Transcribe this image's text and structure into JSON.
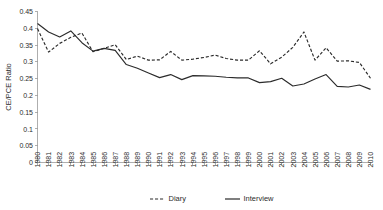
{
  "chart_data": {
    "type": "line",
    "title": "",
    "xlabel": "",
    "ylabel": "CE/PCE Ratio",
    "ylim": [
      0,
      0.45
    ],
    "ytick_step": 0.05,
    "grid": false,
    "legend_position": "bottom",
    "x": [
      1980,
      1981,
      1982,
      1983,
      1984,
      1985,
      1986,
      1987,
      1988,
      1989,
      1990,
      1991,
      1992,
      1993,
      1994,
      1995,
      1996,
      1997,
      1998,
      1999,
      2000,
      2001,
      2002,
      2003,
      2004,
      2005,
      2006,
      2007,
      2008,
      2009,
      2010
    ],
    "xtick_labels": [
      "1980",
      "1981",
      "1982",
      "1983",
      "1984",
      "1985",
      "1986",
      "1987",
      "1988",
      "1989",
      "1990",
      "1991",
      "1992",
      "1993",
      "1994",
      "1995",
      "1996",
      "1997",
      "1998",
      "1999",
      "2000",
      "2001",
      "2002",
      "2003",
      "2004",
      "2005",
      "2006",
      "2007",
      "2008",
      "2009",
      "2010"
    ],
    "ytick_labels": [
      "0",
      "0.05",
      "0.1",
      "0.15",
      "0.2",
      "0.25",
      "0.3",
      "0.35",
      "0.4",
      "0.45"
    ],
    "ytick_values": [
      0,
      0.05,
      0.1,
      0.15,
      0.2,
      0.25,
      0.3,
      0.35,
      0.4,
      0.45
    ],
    "series": [
      {
        "name": "Diary",
        "style": "dashed",
        "color": "#2b2b2b",
        "values": [
          0.399,
          0.329,
          0.355,
          0.373,
          0.386,
          0.33,
          0.34,
          0.351,
          0.307,
          0.317,
          0.305,
          0.306,
          0.331,
          0.305,
          0.308,
          0.313,
          0.32,
          0.31,
          0.305,
          0.305,
          0.333,
          0.294,
          0.314,
          0.343,
          0.389,
          0.305,
          0.342,
          0.302,
          0.303,
          0.298,
          0.251
        ]
      },
      {
        "name": "Interview",
        "style": "solid",
        "color": "#2b2b2b",
        "values": [
          0.414,
          0.389,
          0.374,
          0.392,
          0.357,
          0.332,
          0.34,
          0.334,
          0.292,
          0.281,
          0.267,
          0.253,
          0.262,
          0.247,
          0.259,
          0.258,
          0.257,
          0.254,
          0.252,
          0.252,
          0.238,
          0.241,
          0.251,
          0.228,
          0.234,
          0.249,
          0.262,
          0.227,
          0.225,
          0.231,
          0.218
        ]
      }
    ]
  },
  "legend": {
    "items": [
      {
        "label": "Diary",
        "style": "dashed"
      },
      {
        "label": "Interview",
        "style": "solid"
      }
    ]
  }
}
